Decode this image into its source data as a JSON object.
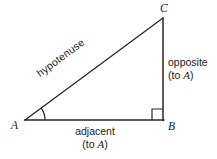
{
  "figure": {
    "type": "right-triangle-trigonometry-diagram",
    "background_color": "#ffffff",
    "stroke_color": "#262626",
    "text_color": "#1a1a1a",
    "vertices": {
      "a": {
        "label": "A",
        "x": 25,
        "y": 120
      },
      "b": {
        "label": "B",
        "x": 163,
        "y": 120
      },
      "c": {
        "label": "C",
        "x": 163,
        "y": 18
      }
    },
    "sides": {
      "hypotenuse": {
        "label": "hypotenuse",
        "from": "A",
        "to": "C"
      },
      "opposite": {
        "label_line1": "opposite",
        "label_line2_prefix": "(to ",
        "label_line2_var": "A",
        "label_line2_suffix": ")",
        "from": "C",
        "to": "B"
      },
      "adjacent": {
        "label_line1": "adjacent",
        "label_line2_prefix": "(to ",
        "label_line2_var": "A",
        "label_line2_suffix": ")",
        "from": "A",
        "to": "B"
      }
    },
    "markers": {
      "angle_arc_at_a": {
        "radius": 20,
        "description": "angle-arc"
      },
      "right_angle_at_b": {
        "size": 11,
        "description": "right-angle-square"
      }
    }
  }
}
